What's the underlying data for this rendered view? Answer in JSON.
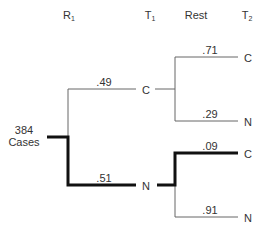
{
  "headers": {
    "r1": {
      "base": "R",
      "sub": "1"
    },
    "t1": {
      "base": "T",
      "sub": "1"
    },
    "rest": "Rest",
    "t2": {
      "base": "T",
      "sub": "2"
    }
  },
  "root": {
    "count": "384",
    "label": "Cases"
  },
  "branches": {
    "top_prob": ".49",
    "top_node": "C",
    "bottom_prob": ".51",
    "bottom_node": "N"
  },
  "leaves": {
    "cc_prob": ".71",
    "cc_label": "C",
    "cn_prob": ".29",
    "cn_label": "N",
    "nc_prob": ".09",
    "nc_label": "C",
    "nn_prob": ".91",
    "nn_label": "N"
  },
  "colors": {
    "thin": "#666666",
    "thick": "#111111"
  }
}
